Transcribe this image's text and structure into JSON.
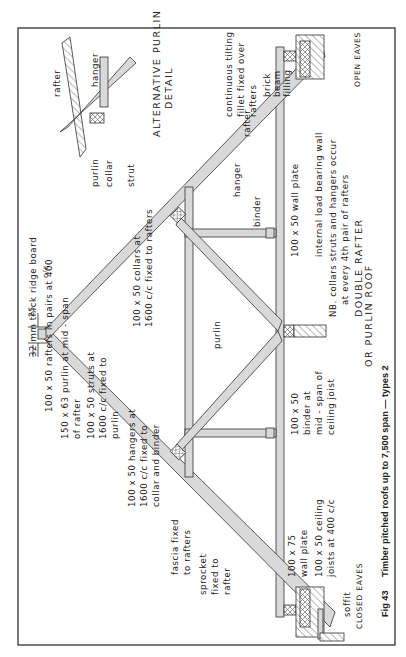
{
  "figure": {
    "number": "Fig 43",
    "caption": "Timber pitched roofs up to 7,500 span — types 2",
    "title_line1": "DOUBLE  RAFTER",
    "title_line2": "OR  PURLIN  ROOF"
  },
  "detail": {
    "title_line1": "ALTERNATIVE  PURLIN",
    "title_line2": "DETAIL",
    "labels": {
      "rafter": "rafter",
      "hanger": "hanger",
      "purlin": "purlin",
      "collar": "collar",
      "strut": "strut"
    }
  },
  "dimension": {
    "value": "25"
  },
  "labels_left": {
    "ridge": "32 mm  thick  ridge  board",
    "rafters_1": "100 x 50  rafters  in  pairs  at  400",
    "rafters_cc": "c/c",
    "purlin_1": "150 x 63  purlin  at  mid - span",
    "purlin_2": "of  rafter",
    "struts_1": "100 x 50  struts  at",
    "struts_2": "1600 c/c  fixed  to",
    "struts_3": "purlin",
    "hangers_1": "100 x 50  hangers  at",
    "hangers_2": "1600 c/c  fixed  to",
    "hangers_3": "collar  and  binder",
    "fascia_1": "fascia  fixed",
    "fascia_2": "to  rafters",
    "sprocket_1": "sprocket",
    "sprocket_2": "fixed  to",
    "sprocket_3": "rafter",
    "soffit": "soffit",
    "closed_eaves": "CLOSED EAVES"
  },
  "labels_center": {
    "collars_1": "100 x 50  collars  at",
    "collars_2": "1600 c/c  fixed  to  rafters",
    "purlin": "purlin",
    "hanger": "hanger",
    "binder": "binder",
    "rafter": "rafter"
  },
  "labels_bottom": {
    "wall_plate_75_1": "100 x 75",
    "wall_plate_75_2": "wall  plate",
    "ceiling_1": "100 x 50  ceiling",
    "ceiling_2": "joists  at  400 c/c",
    "binder_1": "100 x 50",
    "binder_2": "binder  at",
    "binder_3": "mid - span  of",
    "binder_4": "ceiling  joist",
    "wall_plate_50": "100 x 50  wall  plate",
    "internal_wall": "internal  load  bearing  wall",
    "nb_1": "NB.  collars  struts  and  hangers  occur",
    "nb_2": "at  every  4th  pair  of  rafters"
  },
  "labels_right": {
    "fillet_1": "continuous  tilting",
    "fillet_2": "fillet  fixed  over",
    "fillet_3": "rafters",
    "brick_1": "brick",
    "brick_2": "beam",
    "brick_3": "filling",
    "open_eaves": "OPEN EAVES"
  }
}
